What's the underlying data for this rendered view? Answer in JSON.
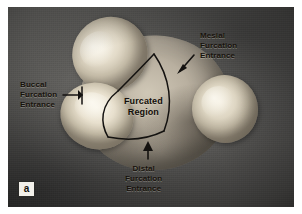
{
  "figure": {
    "panel_label": "a",
    "annotations": [
      {
        "id": "mesial",
        "name": "mesial-furcation-entrance",
        "lines": [
          "Mesial",
          "Furcation",
          "Entrance"
        ],
        "pointer": "arrow-down-left"
      },
      {
        "id": "buccal",
        "name": "buccal-furcation-entrance",
        "lines": [
          "Buccal",
          "Furcation",
          "Entrance"
        ],
        "pointer": "bracket-right"
      },
      {
        "id": "distal",
        "name": "distal-furcation-entrance",
        "lines": [
          "Distal",
          "Furcation",
          "Entrance"
        ],
        "pointer": "arrow-up"
      },
      {
        "id": "region",
        "name": "furcated-region",
        "lines": [
          "Furcated",
          "Region"
        ],
        "pointer": "none"
      }
    ],
    "specimen": {
      "description": "Extracted maxillary molar, apical view",
      "roots": [
        {
          "id": "mesiobuccal",
          "label": "Mesiobuccal root"
        },
        {
          "id": "distobuccal",
          "label": "Distobuccal root"
        },
        {
          "id": "palatal",
          "label": "Palatal root"
        }
      ]
    },
    "colors": {
      "page": "#ffffff",
      "backdrop": "#5c5c5c",
      "annotation_text": "#17120c",
      "outline": "#141210",
      "panel_label_bg": "#f2f0ea",
      "root_tip": "#f4efe2",
      "tooth_body": "#b9b0a0"
    }
  }
}
